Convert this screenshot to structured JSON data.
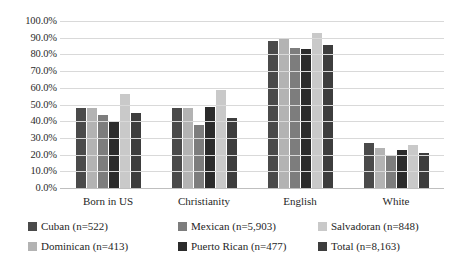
{
  "chart_data": {
    "type": "bar",
    "title": "",
    "xlabel": "",
    "ylabel": "",
    "ylim": [
      0,
      100
    ],
    "grid": true,
    "legend_position": "bottom",
    "categories": [
      "Born in US",
      "Christianity",
      "English",
      "White"
    ],
    "y_ticks": [
      "0.0%",
      "10.0%",
      "20.0%",
      "30.0%",
      "40.0%",
      "50.0%",
      "60.0%",
      "70.0%",
      "80.0%",
      "90.0%",
      "100.0%"
    ],
    "y_tick_values": [
      0,
      10,
      20,
      30,
      40,
      50,
      60,
      70,
      80,
      90,
      100
    ],
    "series": [
      {
        "name": "Cuban (n=522)",
        "color": "#4a4a4a",
        "values": [
          48.0,
          48.0,
          88.0,
          27.0
        ]
      },
      {
        "name": "Dominican (n=413)",
        "color": "#b3b3b3",
        "values": [
          48.0,
          48.0,
          90.0,
          24.0
        ]
      },
      {
        "name": "Mexican (n=5,903)",
        "color": "#7d7d7d",
        "values": [
          44.0,
          38.0,
          84.0,
          20.0
        ]
      },
      {
        "name": "Puerto Rican (n=477)",
        "color": "#2b2b2b",
        "values": [
          39.5,
          48.5,
          83.0,
          23.0
        ]
      },
      {
        "name": "Salvadoran (n=848)",
        "color": "#c9c9c9",
        "values": [
          56.0,
          58.5,
          93.0,
          25.5
        ]
      },
      {
        "name": "Total (n=8,163)",
        "color": "#3d3d3d",
        "values": [
          45.0,
          42.0,
          85.5,
          21.0
        ]
      }
    ]
  }
}
